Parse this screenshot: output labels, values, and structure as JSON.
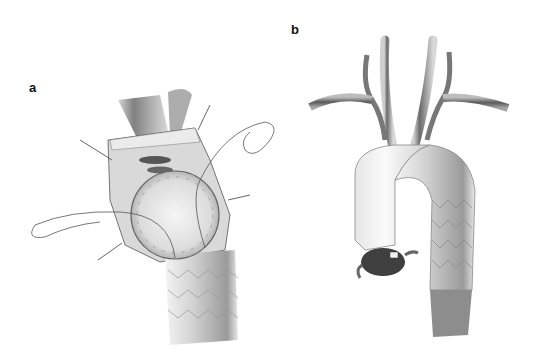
{
  "figure": {
    "panels": [
      {
        "label": "a",
        "subject": "open aortic arch with circular stent-graft cuff sutured into vessel, retracted walls, running suture"
      },
      {
        "label": "b",
        "subject": "aortic arch with supra-aortic branch vessels, hybrid graft with stented descending segment"
      }
    ]
  },
  "colors": {
    "background": "#ffffff",
    "vessel_dark": "#4a4a4a",
    "vessel_mid": "#8c8c8c",
    "graft_light": "#eeeeee",
    "suture": "#555555"
  }
}
